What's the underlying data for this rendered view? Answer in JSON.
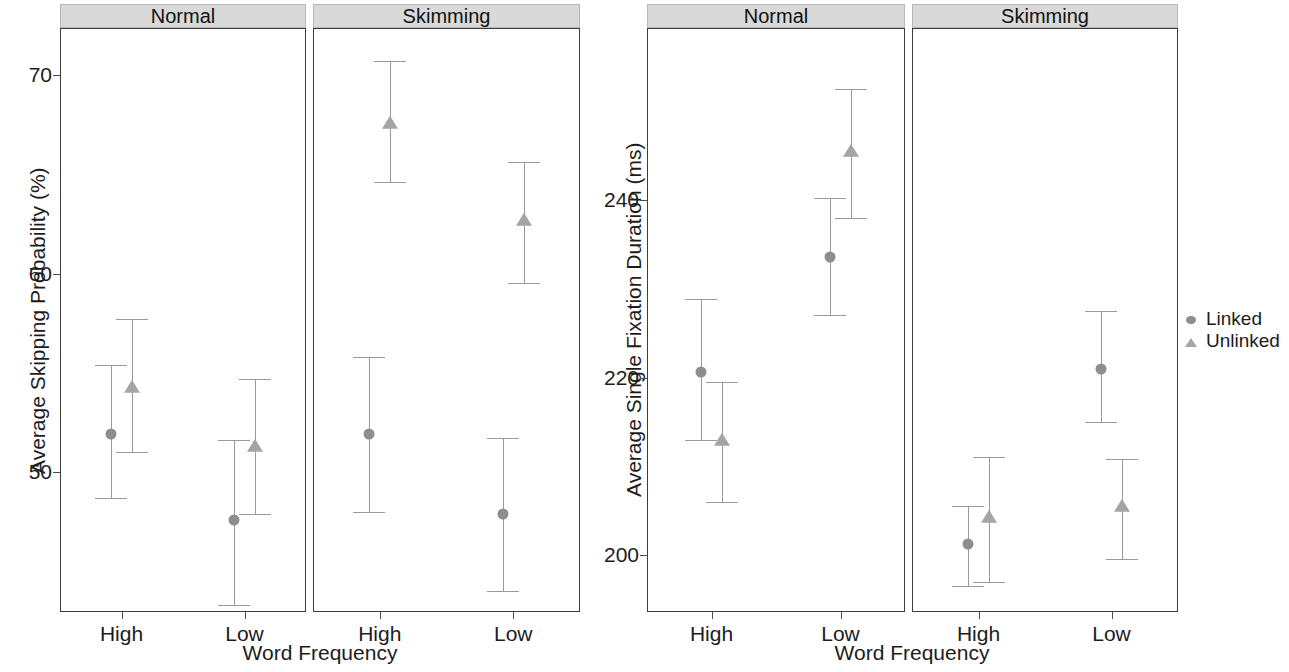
{
  "legend": {
    "position": "right",
    "entries": [
      {
        "label": "Linked",
        "marker": "circle",
        "color": "#8e8e8e"
      },
      {
        "label": "Unlinked",
        "marker": "triangle",
        "color": "#a5a5a5"
      }
    ]
  },
  "panels": {
    "strip_normal": "Normal",
    "strip_skimming": "Skimming"
  },
  "left": {
    "ylabel": "Average Skipping Probability (%)",
    "xlabel": "Word Frequency",
    "yticks": [
      "70",
      "60",
      "50"
    ],
    "xticks": [
      "High",
      "Low",
      "High",
      "Low"
    ]
  },
  "right": {
    "ylabel": "Average Single Fixation Duration (ms)",
    "xlabel": "Word Frequency",
    "yticks": [
      "240",
      "220",
      "200"
    ],
    "xticks": [
      "High",
      "Low",
      "High",
      "Low"
    ]
  },
  "chart_data": [
    {
      "type": "scatter",
      "title": "Average Skipping Probability by Word Frequency and Reading Task",
      "xlabel": "Word Frequency",
      "ylabel": "Average Skipping Probability (%)",
      "ylim": [
        42,
        72.5
      ],
      "yticks": [
        50,
        60,
        70
      ],
      "grid": false,
      "facets": [
        "Normal",
        "Skimming"
      ],
      "categories": [
        "High",
        "Low"
      ],
      "legend": [
        "Linked",
        "Unlinked"
      ],
      "error_bars": "95% CI",
      "series": [
        {
          "facet": "Normal",
          "name": "Linked",
          "points": [
            {
              "x": "High",
              "y": 51.9,
              "lo": 48.7,
              "hi": 55.4
            },
            {
              "x": "Low",
              "y": 47.6,
              "lo": 43.3,
              "hi": 51.6
            }
          ]
        },
        {
          "facet": "Normal",
          "name": "Unlinked",
          "points": [
            {
              "x": "High",
              "y": 54.3,
              "lo": 51.0,
              "hi": 57.7
            },
            {
              "x": "Low",
              "y": 51.3,
              "lo": 47.9,
              "hi": 54.7
            }
          ]
        },
        {
          "facet": "Skimming",
          "name": "Linked",
          "points": [
            {
              "x": "High",
              "y": 51.9,
              "lo": 48.0,
              "hi": 55.8
            },
            {
              "x": "Low",
              "y": 47.9,
              "lo": 44.0,
              "hi": 51.7
            }
          ]
        },
        {
          "facet": "Skimming",
          "name": "Unlinked",
          "points": [
            {
              "x": "High",
              "y": 67.6,
              "lo": 64.6,
              "hi": 70.7
            },
            {
              "x": "Low",
              "y": 62.7,
              "lo": 59.5,
              "hi": 65.6
            }
          ]
        }
      ]
    },
    {
      "type": "scatter",
      "title": "Average Single Fixation Duration by Word Frequency and Reading Task",
      "xlabel": "Word Frequency",
      "ylabel": "Average Single Fixation Duration (ms)",
      "ylim": [
        194,
        256
      ],
      "yticks": [
        200,
        220,
        240
      ],
      "grid": false,
      "facets": [
        "Normal",
        "Skimming"
      ],
      "categories": [
        "High",
        "Low"
      ],
      "legend": [
        "Linked",
        "Unlinked"
      ],
      "error_bars": "95% CI",
      "series": [
        {
          "facet": "Normal",
          "name": "Linked",
          "points": [
            {
              "x": "High",
              "y": 220.6,
              "lo": 213.0,
              "hi": 228.8
            },
            {
              "x": "Low",
              "y": 233.6,
              "lo": 227.0,
              "hi": 240.2
            }
          ]
        },
        {
          "facet": "Normal",
          "name": "Unlinked",
          "points": [
            {
              "x": "High",
              "y": 213.0,
              "lo": 206.0,
              "hi": 219.5
            },
            {
              "x": "Low",
              "y": 245.5,
              "lo": 238.0,
              "hi": 252.5
            }
          ]
        },
        {
          "facet": "Skimming",
          "name": "Linked",
          "points": [
            {
              "x": "High",
              "y": 201.2,
              "lo": 196.5,
              "hi": 205.5
            },
            {
              "x": "Low",
              "y": 221.0,
              "lo": 215.0,
              "hi": 227.5
            }
          ]
        },
        {
          "facet": "Skimming",
          "name": "Unlinked",
          "points": [
            {
              "x": "High",
              "y": 204.3,
              "lo": 197.0,
              "hi": 211.0
            },
            {
              "x": "Low",
              "y": 205.5,
              "lo": 199.5,
              "hi": 210.8
            }
          ]
        }
      ]
    }
  ]
}
